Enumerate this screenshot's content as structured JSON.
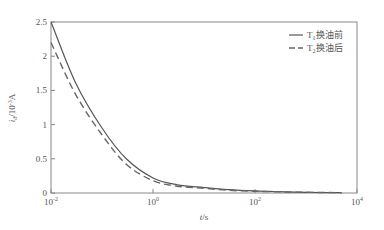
{
  "chart_data": {
    "type": "line",
    "title": "",
    "xlabel": "t/s",
    "ylabel": "i_d/10^-3A",
    "xscale": "log",
    "xlim": [
      0.01,
      10000
    ],
    "ylim": [
      0,
      2.5
    ],
    "grid": false,
    "legend_position": "upper right",
    "x_ticks": [
      {
        "value": 0.01,
        "base": "10",
        "exp": "-2"
      },
      {
        "value": 1,
        "base": "10",
        "exp": "0"
      },
      {
        "value": 100,
        "base": "10",
        "exp": "2"
      },
      {
        "value": 10000,
        "base": "10",
        "exp": "4"
      }
    ],
    "y_ticks": [
      "0",
      "0.5",
      "1",
      "1.5",
      "2",
      "2.5"
    ],
    "series": [
      {
        "name": "T1换油前",
        "legend_main": "T",
        "legend_sub": "1",
        "legend_rest": "换油前",
        "style": "solid",
        "color": "#555555",
        "x": [
          0.01,
          0.03,
          0.1,
          0.3,
          1,
          3,
          10,
          30,
          100,
          300,
          1000,
          5000
        ],
        "values": [
          2.5,
          1.62,
          0.95,
          0.5,
          0.22,
          0.12,
          0.08,
          0.05,
          0.03,
          0.02,
          0.01,
          0.005
        ]
      },
      {
        "name": "T2换油后",
        "legend_main": "T",
        "legend_sub": "2",
        "legend_rest": "换油后",
        "style": "dashed",
        "color": "#666666",
        "x": [
          0.01,
          0.03,
          0.1,
          0.3,
          1,
          3,
          10,
          30,
          100,
          300,
          1000,
          5000
        ],
        "values": [
          2.2,
          1.45,
          0.85,
          0.42,
          0.18,
          0.1,
          0.07,
          0.04,
          0.025,
          0.017,
          0.01,
          0.005
        ]
      }
    ]
  },
  "axis_labels": {
    "x_main": "t",
    "x_unit": "/s",
    "y_main": "i",
    "y_sub": "d",
    "y_rest": "/10",
    "y_exp": "-3",
    "y_unit": "A"
  }
}
